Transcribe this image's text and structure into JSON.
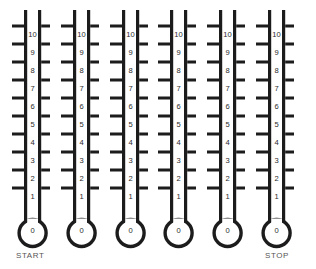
{
  "diagram": {
    "background_color": "#ffffff",
    "ink_color": "#1c1c1c",
    "text_color": "#2b2b2b",
    "label_color": "#555555",
    "count": 6,
    "scale_values": [
      "10",
      "9",
      "8",
      "7",
      "6",
      "5",
      "4",
      "3",
      "2",
      "1"
    ],
    "bulb_value": "0",
    "thermometers": [
      {
        "index": 1,
        "x": 11,
        "scale_values": [
          "10",
          "9",
          "8",
          "7",
          "6",
          "5",
          "4",
          "3",
          "2",
          "1"
        ],
        "bulb_value": "0"
      },
      {
        "index": 2,
        "x": 60,
        "scale_values": [
          "10",
          "9",
          "8",
          "7",
          "6",
          "5",
          "4",
          "3",
          "2",
          "1"
        ],
        "bulb_value": "0"
      },
      {
        "index": 3,
        "x": 109,
        "scale_values": [
          "10",
          "9",
          "8",
          "7",
          "6",
          "5",
          "4",
          "3",
          "2",
          "1"
        ],
        "bulb_value": "0"
      },
      {
        "index": 4,
        "x": 157,
        "scale_values": [
          "10",
          "9",
          "8",
          "7",
          "6",
          "5",
          "4",
          "3",
          "2",
          "1"
        ],
        "bulb_value": "0"
      },
      {
        "index": 5,
        "x": 206,
        "scale_values": [
          "10",
          "9",
          "8",
          "7",
          "6",
          "5",
          "4",
          "3",
          "2",
          "1"
        ],
        "bulb_value": "0"
      },
      {
        "index": 6,
        "x": 255,
        "scale_values": [
          "10",
          "9",
          "8",
          "7",
          "6",
          "5",
          "4",
          "3",
          "2",
          "1"
        ],
        "bulb_value": "0"
      }
    ],
    "labels": {
      "start": "START",
      "stop": "STOP"
    }
  }
}
